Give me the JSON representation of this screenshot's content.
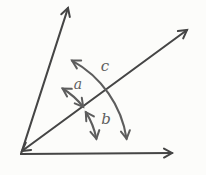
{
  "figure": {
    "kind": "angle-diagram",
    "labels": [
      {
        "id": "a",
        "text": "a",
        "marks": "angle-arc between steep ray and diagonal line"
      },
      {
        "id": "b",
        "text": "b",
        "marks": "angle-arc between diagonal line and horizontal ray"
      },
      {
        "id": "c",
        "text": "c",
        "marks": "angle-arc between steep ray and horizontal ray"
      }
    ],
    "elements": {
      "rays": [
        "steep-ray-arrow-up",
        "diagonal-line-double-arrow",
        "horizontal-ray-arrow-right"
      ],
      "arcs": [
        "arc-a-double-arrow",
        "arc-b-double-arrow",
        "arc-c-double-arrow"
      ]
    },
    "colors": {
      "ray": "#454545",
      "arc": "#5d5d5d",
      "label": "#5f5f5f",
      "background": "#fcfcfa"
    }
  }
}
